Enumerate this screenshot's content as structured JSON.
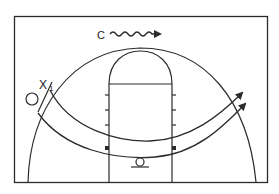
{
  "diagram": {
    "type": "basketball-half-court-play",
    "line_color": "#2b2b2b",
    "background": "#ffffff",
    "labels": {
      "coach": "C",
      "defender": "X",
      "defender_sub": "1",
      "shooter_symbol": "O"
    },
    "elements": {
      "court_boundary": "half court rectangle",
      "three_point_arc": "arc",
      "key_lane": "lane with free-throw circle",
      "lane_hash_marks": 4,
      "block_markers": 2,
      "paths": [
        {
          "name": "outer-cut-path",
          "from": "left wing",
          "to": "right wing",
          "arrow": true
        },
        {
          "name": "inner-cut-path",
          "from": "left wing",
          "to": "right wing",
          "arrow": true
        }
      ],
      "dribble_path": {
        "from": "coach",
        "direction": "right",
        "style": "wavy",
        "arrow": true
      },
      "basket": "circle under the basket"
    }
  }
}
